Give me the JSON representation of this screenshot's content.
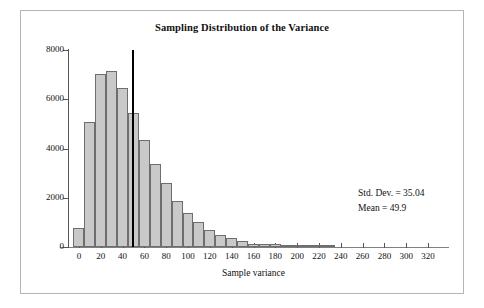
{
  "chart_data": {
    "type": "bar",
    "title": "Sampling Distribution of the Variance",
    "xlabel": "Sample variance",
    "ylabel": "",
    "xlim": [
      -10,
      330
    ],
    "ylim": [
      0,
      8000
    ],
    "grid": false,
    "legend": null,
    "bin_width": 10,
    "categories": [
      "0",
      "10",
      "20",
      "30",
      "40",
      "50",
      "60",
      "70",
      "80",
      "90",
      "100",
      "110",
      "120",
      "130",
      "140",
      "150",
      "160",
      "170",
      "180",
      "190",
      "200",
      "210",
      "220",
      "230"
    ],
    "bin_starts": [
      -5,
      5,
      15,
      25,
      35,
      45,
      55,
      65,
      75,
      85,
      95,
      105,
      115,
      125,
      135,
      145,
      155,
      165,
      175,
      185,
      195,
      205,
      215,
      225
    ],
    "values": [
      790,
      5080,
      7010,
      7130,
      6470,
      5440,
      4340,
      3370,
      2590,
      1880,
      1390,
      1030,
      690,
      500,
      370,
      240,
      140,
      110,
      110,
      60,
      40,
      25,
      15,
      10
    ],
    "x_ticks": [
      0,
      20,
      40,
      60,
      80,
      100,
      120,
      140,
      160,
      180,
      200,
      220,
      240,
      260,
      280,
      300,
      320
    ],
    "y_ticks": [
      0,
      2000,
      4000,
      6000,
      8000
    ],
    "x_tick_labels": [
      "0",
      "20",
      "40",
      "60",
      "80",
      "100",
      "120",
      "140",
      "160",
      "180",
      "200",
      "220",
      "240",
      "260",
      "280",
      "300",
      "320"
    ],
    "y_tick_labels": [
      "0",
      "2000",
      "4000",
      "6000",
      "8000"
    ],
    "annotations": [
      {
        "name": "std-dev",
        "text": "Std. Dev. = 35.04"
      },
      {
        "name": "mean",
        "text": "Mean = 49.9"
      }
    ],
    "reference_line": {
      "name": "mean-line",
      "x": 50,
      "y_top": 8000,
      "color": "#000000"
    },
    "colors": {
      "bar_fill": "#c9c9c9",
      "bar_stroke": "#6e6e6e",
      "axis": "#555555",
      "text": "#111111",
      "frame": "#b5b5b5"
    }
  },
  "stats": {
    "std_dev_label": "Std. Dev. = 35.04",
    "mean_label": "Mean = 49.9"
  }
}
